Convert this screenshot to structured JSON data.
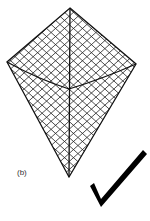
{
  "figure": {
    "label": "(b)",
    "kite": {
      "vertices": {
        "top": [
          70,
          8
        ],
        "left": [
          7,
          62
        ],
        "right": [
          136,
          64
        ],
        "bottom": [
          69,
          177
        ],
        "center": [
          69,
          89
        ]
      },
      "grid_spacing": 6,
      "grid_angle_deg": 42,
      "stroke_color": "#111111"
    },
    "checkmark": {
      "points": [
        [
          90,
          187
        ],
        [
          100,
          206
        ],
        [
          145,
          152
        ]
      ],
      "color": "#000000"
    }
  }
}
